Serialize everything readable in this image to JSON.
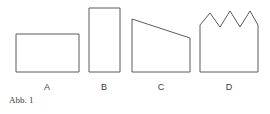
{
  "figure": {
    "caption": "Abb. 1",
    "background_color": "#ffffff",
    "stroke_color": "#5a5a5a",
    "fill_color": "#ffffff",
    "label_color": "#3a3a3a",
    "caption_color": "#3d3d3d",
    "baseline_y": 72,
    "shapes": [
      {
        "label": "A",
        "kind": "rectangle",
        "description": "wide short rectangle",
        "x_left": 16,
        "x_right": 79,
        "y_top": 34,
        "y_bottom": 72,
        "width": 63,
        "height": 38,
        "points": "16,34 79,34 79,72 16,72",
        "label_x": 47,
        "label_y": 82
      },
      {
        "label": "B",
        "kind": "rectangle",
        "description": "narrow tall rectangle",
        "x_left": 89,
        "x_right": 120,
        "y_top": 8,
        "y_bottom": 72,
        "width": 31,
        "height": 64,
        "points": "89,8 120,8 120,72 89,72",
        "label_x": 104,
        "label_y": 82
      },
      {
        "label": "C",
        "kind": "trapezoid",
        "description": "right trapezoid with top edge sloping down to the right",
        "x_left": 132,
        "x_right": 190,
        "y_top_left": 19,
        "y_top_right": 38,
        "y_bottom": 72,
        "width": 58,
        "height_left": 53,
        "height_right": 34,
        "points": "132,19 190,38 190,72 132,72",
        "label_x": 161,
        "label_y": 82
      },
      {
        "label": "D",
        "kind": "zigzag-top polygon",
        "description": "rectangle with sawtooth top: three peaks and two valleys",
        "x_left": 200,
        "x_right": 258,
        "y_shoulder_left": 25,
        "y_shoulder_right": 25,
        "y_peak": 11,
        "y_valley": 27,
        "y_bottom": 72,
        "width": 58,
        "peak_count": 3,
        "valley_count": 2,
        "points": "200,25 210,13 220,27 230,11 240,27 250,11 258,25 258,72 200,72",
        "label_x": 229,
        "label_y": 82
      }
    ]
  }
}
